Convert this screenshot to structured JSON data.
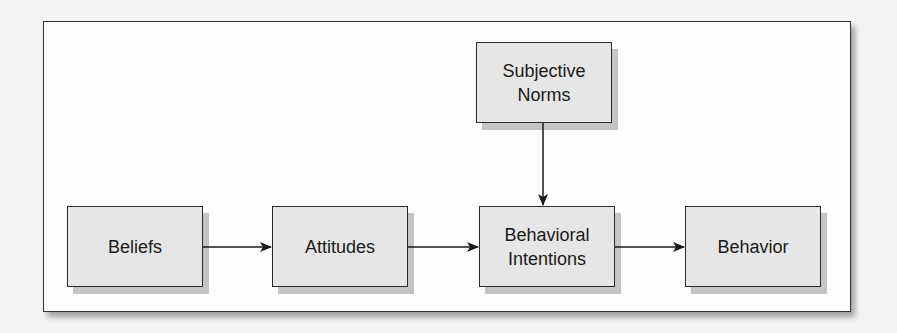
{
  "diagram": {
    "title": "",
    "nodes": [
      {
        "id": "beliefs",
        "label": "Beliefs"
      },
      {
        "id": "attitudes",
        "label": "Attitudes"
      },
      {
        "id": "subjective_norms",
        "label": "Subjective\nNorms"
      },
      {
        "id": "behavioral_intentions",
        "label": "Behavioral\nIntentions"
      },
      {
        "id": "behavior",
        "label": "Behavior"
      }
    ],
    "edges": [
      {
        "from": "beliefs",
        "to": "attitudes"
      },
      {
        "from": "attitudes",
        "to": "behavioral_intentions"
      },
      {
        "from": "subjective_norms",
        "to": "behavioral_intentions"
      },
      {
        "from": "behavioral_intentions",
        "to": "behavior"
      }
    ],
    "colors": {
      "node_fill": "#e6e6e6",
      "node_border": "#2a2a2a",
      "node_shadow": "#c4c4c4",
      "frame_fill": "#fdfdfd",
      "line": "#1a1a1a"
    }
  }
}
